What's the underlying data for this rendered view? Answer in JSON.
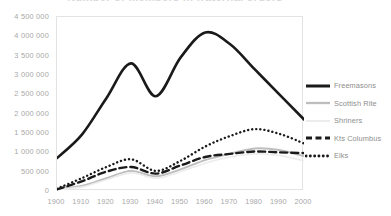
{
  "chart_data": {
    "type": "line",
    "title": "Number of members in fraternal orders",
    "xlabel": "",
    "ylabel": "",
    "x": [
      1900,
      1910,
      1920,
      1930,
      1940,
      1950,
      1960,
      1970,
      1980,
      1990,
      2000
    ],
    "xtick_labels": [
      "1900",
      "1910",
      "1920",
      "1930",
      "1940",
      "1950",
      "1960",
      "1970",
      "1980",
      "1990",
      "2000"
    ],
    "ytick_labels": [
      "4 500 000",
      "4 000 000",
      "3 500 000",
      "3 000 000",
      "2 500 000",
      "2 000 000",
      "1 500 000",
      "1 000 000",
      "500 000",
      "0"
    ],
    "ytick_values": [
      4500000,
      4000000,
      3500000,
      3000000,
      2500000,
      2000000,
      1500000,
      1000000,
      500000,
      0
    ],
    "ylim": [
      0,
      4500000
    ],
    "xlim": [
      1900,
      2000
    ],
    "grid": false,
    "legend_position": "right",
    "series": [
      {
        "name": "Freemasons",
        "color": "#1a1a1a",
        "style": "solid",
        "width": 2.6,
        "values": [
          850000,
          1450000,
          2400000,
          3300000,
          2450000,
          3450000,
          4100000,
          3800000,
          3150000,
          2500000,
          1850000
        ]
      },
      {
        "name": "Scottish Rite",
        "color": "#bdbdbd",
        "style": "solid",
        "width": 1.9,
        "values": [
          60000,
          130000,
          330000,
          520000,
          380000,
          560000,
          800000,
          960000,
          1100000,
          1060000,
          900000
        ]
      },
      {
        "name": "Shriners",
        "color": "#ececec",
        "style": "solid",
        "width": 1.6,
        "values": [
          40000,
          100000,
          290000,
          470000,
          330000,
          500000,
          720000,
          880000,
          960000,
          920000,
          780000
        ]
      },
      {
        "name": "Kts Columbus",
        "color": "#1a1a1a",
        "style": "dashed",
        "width": 2.4,
        "values": [
          40000,
          250000,
          500000,
          620000,
          450000,
          660000,
          880000,
          960000,
          1020000,
          1000000,
          980000
        ]
      },
      {
        "name": "Elks",
        "color": "#1a1a1a",
        "style": "dotted",
        "width": 2.4,
        "values": [
          60000,
          330000,
          620000,
          820000,
          520000,
          780000,
          1150000,
          1420000,
          1600000,
          1480000,
          1230000
        ]
      }
    ]
  }
}
